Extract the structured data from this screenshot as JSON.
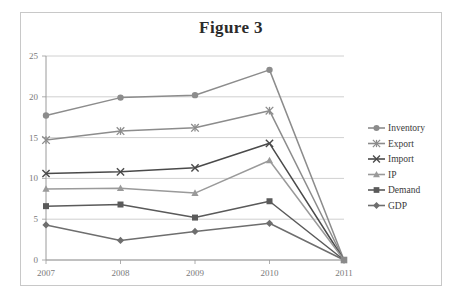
{
  "figure": {
    "title": "Figure 3",
    "frame_color": "#c8c8c8",
    "background": "#ffffff"
  },
  "chart_data": {
    "type": "line",
    "title": "Figure 3",
    "xlabel": "",
    "ylabel": "",
    "categories": [
      "2007",
      "2008",
      "2009",
      "2010",
      "2011"
    ],
    "x": [
      2007,
      2008,
      2009,
      2010,
      2011
    ],
    "ylim": [
      0,
      25
    ],
    "yticks": [
      0,
      5,
      10,
      15,
      20,
      25
    ],
    "ytick_labels": [
      "0",
      "5",
      "10",
      "15",
      "20",
      "25"
    ],
    "grid": true,
    "grid_axis": "y",
    "legend_position": "right",
    "series": [
      {
        "name": "Inventory",
        "marker": "circle",
        "color": "#8c8c8c",
        "values": [
          17.7,
          19.9,
          20.2,
          23.3,
          0.0
        ]
      },
      {
        "name": "Export",
        "marker": "asterisk",
        "color": "#8c8c8c",
        "values": [
          14.7,
          15.8,
          16.2,
          18.3,
          0.0
        ]
      },
      {
        "name": "Import",
        "marker": "x",
        "color": "#4a4a4a",
        "values": [
          10.6,
          10.8,
          11.3,
          14.3,
          0.0
        ]
      },
      {
        "name": "IP",
        "marker": "triangle",
        "color": "#9a9a9a",
        "values": [
          8.7,
          8.8,
          8.2,
          12.2,
          0.0
        ]
      },
      {
        "name": "Demand",
        "marker": "square",
        "color": "#5a5a5a",
        "values": [
          6.6,
          6.8,
          5.2,
          7.2,
          0.0
        ]
      },
      {
        "name": "GDP",
        "marker": "diamond",
        "color": "#6e6e6e",
        "values": [
          4.3,
          2.4,
          3.5,
          4.5,
          0.0
        ]
      }
    ]
  },
  "legend": {
    "items": [
      {
        "label": "Inventory"
      },
      {
        "label": "Export"
      },
      {
        "label": "Import"
      },
      {
        "label": "IP"
      },
      {
        "label": "Demand"
      },
      {
        "label": "GDP"
      }
    ]
  }
}
